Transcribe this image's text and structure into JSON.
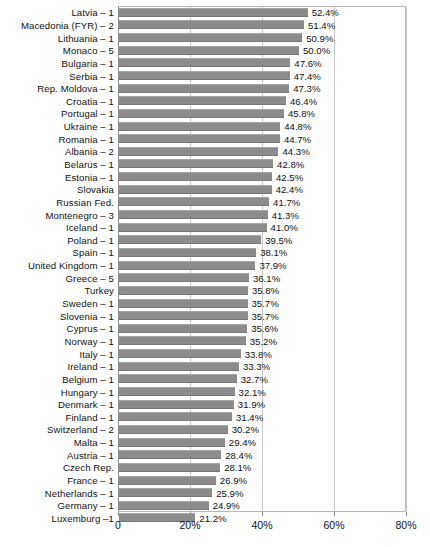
{
  "chart_data": {
    "type": "bar",
    "orientation": "horizontal",
    "title": "",
    "subtitle": "",
    "xlabel": "",
    "ylabel": "",
    "xlim": [
      0,
      80
    ],
    "xticks": [
      "0",
      "20%",
      "40%",
      "60%",
      "80%"
    ],
    "xtick_values": [
      0,
      20,
      40,
      60,
      80
    ],
    "grid": "vertical",
    "legend": "none",
    "value_suffix": "%",
    "bar_color": "#8c8c8c",
    "gridline_color": "#c8c8c8",
    "axis_color": "#8f8f8f",
    "categories": [
      "Latvia – 1",
      "Macedonia (FYR) – 2",
      "Lithuania – 1",
      "Monaco – 5",
      "Bulgaria – 1",
      "Serbia – 1",
      "Rep. Moldova – 1",
      "Croatia – 1",
      "Portugal – 1",
      "Ukraine – 1",
      "Romania – 1",
      "Albania – 2",
      "Belarus – 1",
      "Estonia – 1",
      "Slovakia",
      "Russian Fed.",
      "Montenegro – 3",
      "Iceland – 1",
      "Poland – 1",
      "Spain – 1",
      "United Kingdom – 1",
      "Greece – 5",
      "Turkey",
      "Sweden – 1",
      "Slovenia – 1",
      "Cyprus – 1",
      "Norway – 1",
      "Italy – 1",
      "Ireland – 1",
      "Belgium – 1",
      "Hungary – 1",
      "Denmark – 1",
      "Finland – 1",
      "Switzerland – 2",
      "Malta – 1",
      "Austria – 1",
      "Czech Rep.",
      "France – 1",
      "Netherlands – 1",
      "Germany – 1",
      "Luxemburg –1"
    ],
    "values": [
      52.4,
      51.4,
      50.9,
      50.0,
      47.6,
      47.4,
      47.3,
      46.4,
      45.8,
      44.8,
      44.7,
      44.3,
      42.8,
      42.5,
      42.4,
      41.7,
      41.3,
      41.0,
      39.5,
      38.1,
      37.9,
      36.1,
      35.8,
      35.7,
      35.7,
      35.6,
      35.2,
      33.8,
      33.3,
      32.7,
      32.1,
      31.9,
      31.4,
      30.2,
      29.4,
      28.4,
      28.1,
      26.9,
      25.9,
      24.9,
      21.2
    ],
    "value_labels": [
      "52.4%",
      "51.4%",
      "50.9%",
      "50.0%",
      "47.6%",
      "47.4%",
      "47.3%",
      "46.4%",
      "45.8%",
      "44.8%",
      "44.7%",
      "44.3%",
      "42.8%",
      "42.5%",
      "42.4%",
      "41.7%",
      "41.3%",
      "41.0%",
      "39.5%",
      "38.1%",
      "37.9%",
      "36.1%",
      "35.8%",
      "35.7%",
      "35.7%",
      "35.6%",
      "35.2%",
      "33.8%",
      "33.3%",
      "32.7%",
      "32.1%",
      "31.9%",
      "31.4%",
      "30.2%",
      "29.4%",
      "28.4%",
      "28.1%",
      "26.9%",
      "25.9%",
      "24.9%",
      "21.2%"
    ]
  }
}
